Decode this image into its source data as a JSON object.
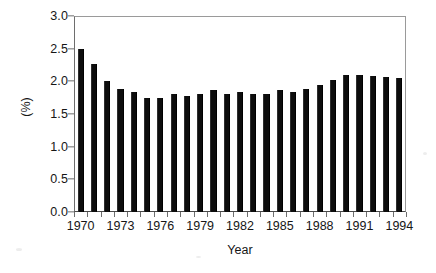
{
  "chart_data": {
    "type": "bar",
    "title": "",
    "subtitle": "",
    "xlabel": "Year",
    "ylabel": "(%)",
    "grid": false,
    "legend": null,
    "legend_position": "none",
    "bar_color": "#0d0d0d",
    "xlim": [
      1969.5,
      1994.5
    ],
    "ylim": [
      0.0,
      3.0
    ],
    "ytick_step": 0.5,
    "ytick_labels": [
      "0.0",
      "0.5",
      "1.0",
      "1.5",
      "2.0",
      "2.5",
      "3.0"
    ],
    "ytick_values": [
      0.0,
      0.5,
      1.0,
      1.5,
      2.0,
      2.5,
      3.0
    ],
    "xtick_labels": [
      "1970",
      "1973",
      "1976",
      "1979",
      "1982",
      "1985",
      "1988",
      "1991",
      "1994"
    ],
    "xtick_values": [
      1970,
      1973,
      1976,
      1979,
      1982,
      1985,
      1988,
      1991,
      1994
    ],
    "categories": [
      "1970",
      "1971",
      "1972",
      "1973",
      "1974",
      "1975",
      "1976",
      "1977",
      "1978",
      "1979",
      "1980",
      "1981",
      "1982",
      "1983",
      "1984",
      "1985",
      "1986",
      "1987",
      "1988",
      "1989",
      "1990",
      "1991",
      "1992",
      "1993",
      "1994"
    ],
    "values": [
      2.49,
      2.27,
      2.01,
      1.88,
      1.83,
      1.75,
      1.75,
      1.8,
      1.77,
      1.81,
      1.86,
      1.81,
      1.84,
      1.81,
      1.81,
      1.86,
      1.84,
      1.89,
      1.95,
      2.02,
      2.09,
      2.09,
      2.08,
      2.06,
      2.05
    ],
    "value_unit": "%"
  }
}
